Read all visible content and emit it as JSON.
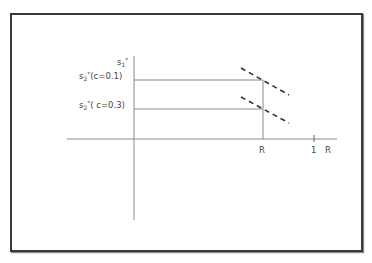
{
  "diagram": {
    "labels": {
      "y_axis": {
        "base": "s",
        "sub": "1",
        "sup": "*"
      },
      "line_high": {
        "base": "s",
        "sub": "2",
        "sup": "*",
        "rest": "(c=0.1)"
      },
      "line_low": {
        "base": "s",
        "sub": "2",
        "sup": "*",
        "rest": "( c=0.3)"
      },
      "x_tick_R": "R",
      "x_tick_1": "1",
      "x_axis": "R"
    },
    "colors": {
      "axis": "#8a8a8a",
      "dashed": "#333333",
      "frame": "#3a3a3a",
      "text": "#444444"
    }
  }
}
